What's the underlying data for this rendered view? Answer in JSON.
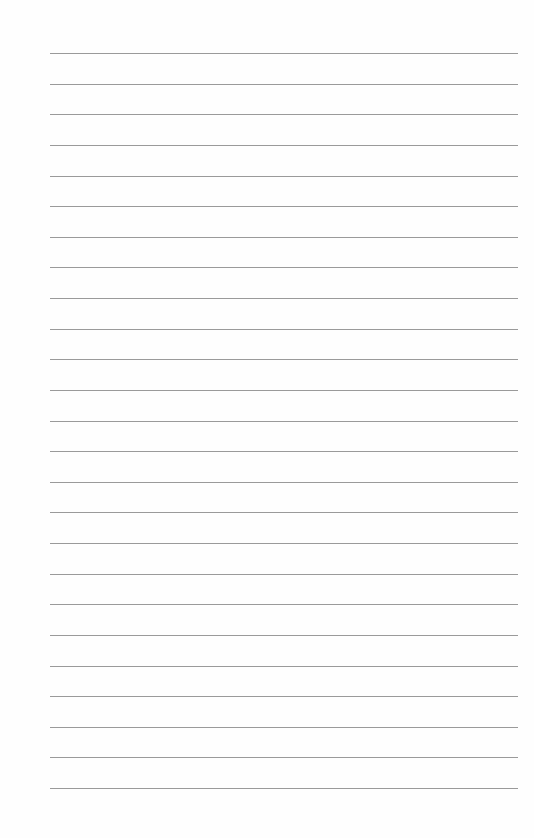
{
  "paper": {
    "type": "lined-paper",
    "line_count": 25,
    "line_color": "#9a9a9a",
    "background": "#fefefe",
    "first_line_y": 53,
    "line_spacing": 30.625,
    "line_left": 50,
    "line_right": 518
  }
}
